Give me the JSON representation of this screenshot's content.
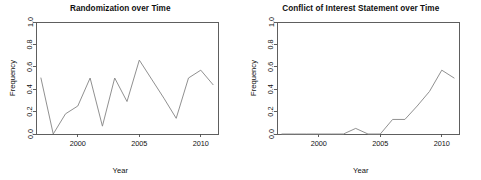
{
  "figure": {
    "width": 481,
    "height": 180,
    "background": "#ffffff",
    "line_color": "#8a8a8a",
    "axis_color": "#4d4d4d",
    "text_color": "#111111"
  },
  "chart_data": [
    {
      "type": "line",
      "title": "Randomization over Time",
      "xlabel": "Year",
      "ylabel": "Frequency",
      "xlim": [
        1996.6,
        2011.4
      ],
      "ylim": [
        0.0,
        1.0
      ],
      "xticks": [
        2000,
        2005,
        2010
      ],
      "xticklabels": [
        "2000",
        "2005",
        "2010"
      ],
      "yticks": [
        0.0,
        0.2,
        0.4,
        0.6,
        0.8,
        1.0
      ],
      "yticklabels": [
        "0.0",
        "0.2",
        "0.4",
        "0.6",
        "0.8",
        "1.0"
      ],
      "grid": false,
      "legend": "none",
      "x": [
        1997,
        1998,
        1999,
        2000,
        2001,
        2002,
        2003,
        2004,
        2005,
        2006,
        2007,
        2008,
        2009,
        2010,
        2011
      ],
      "values": [
        0.5,
        0.0,
        0.18,
        0.25,
        0.5,
        0.07,
        0.5,
        0.29,
        0.66,
        0.49,
        0.32,
        0.14,
        0.5,
        0.57,
        0.44
      ],
      "series": [
        {
          "name": "Randomization",
          "values": [
            0.5,
            0.0,
            0.18,
            0.25,
            0.5,
            0.07,
            0.5,
            0.29,
            0.66,
            0.49,
            0.32,
            0.14,
            0.5,
            0.57,
            0.44
          ]
        }
      ]
    },
    {
      "type": "line",
      "title": "Conflict of Interest Statement over Time",
      "xlabel": "Year",
      "ylabel": "Frequency",
      "xlim": [
        1996.6,
        2011.4
      ],
      "ylim": [
        0.0,
        1.0
      ],
      "xticks": [
        2000,
        2005,
        2010
      ],
      "xticklabels": [
        "2000",
        "2005",
        "2010"
      ],
      "yticks": [
        0.0,
        0.2,
        0.4,
        0.6,
        0.8,
        1.0
      ],
      "yticklabels": [
        "0.0",
        "0.2",
        "0.4",
        "0.6",
        "0.8",
        "1.0"
      ],
      "grid": false,
      "legend": "none",
      "x": [
        1997,
        1998,
        1999,
        2000,
        2001,
        2002,
        2003,
        2004,
        2005,
        2006,
        2007,
        2008,
        2009,
        2010,
        2011
      ],
      "values": [
        0.0,
        0.0,
        0.0,
        0.0,
        0.0,
        0.0,
        0.05,
        0.0,
        0.0,
        0.13,
        0.13,
        0.25,
        0.38,
        0.57,
        0.5
      ],
      "series": [
        {
          "name": "Conflict of Interest Statement",
          "values": [
            0.0,
            0.0,
            0.0,
            0.0,
            0.0,
            0.0,
            0.05,
            0.0,
            0.0,
            0.13,
            0.13,
            0.25,
            0.38,
            0.57,
            0.5
          ]
        }
      ]
    }
  ]
}
